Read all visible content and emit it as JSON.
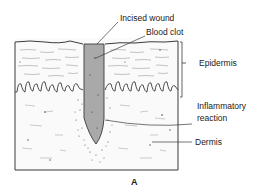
{
  "figure": {
    "panel_label": "A",
    "labels": {
      "incised_wound": "Incised wound",
      "blood_clot": "Blood clot",
      "epidermis": "Epidermis",
      "inflammatory_line1": "Inflammatory",
      "inflammatory_line2": "reaction",
      "dermis": "Dermis"
    },
    "colors": {
      "outline": "#3a3a3a",
      "clot_fill": "#a9a9a9",
      "background": "#ffffff",
      "text": "#1a1a1a"
    }
  }
}
